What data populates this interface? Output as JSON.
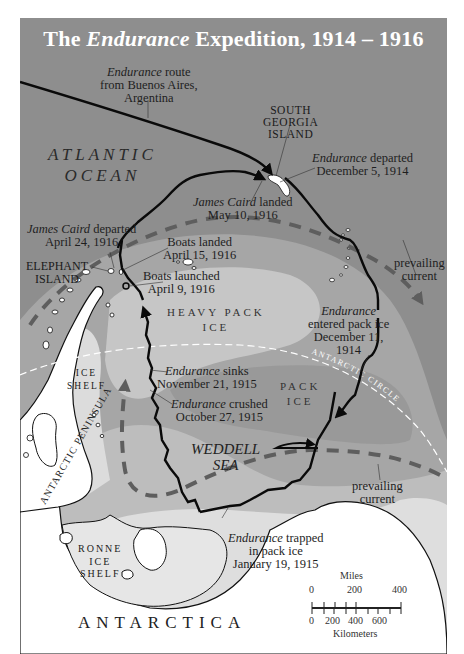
{
  "map": {
    "title_prefix": "The",
    "title_italic": "Endurance",
    "title_suffix": "Expedition, 1914 – 1916",
    "colors": {
      "ocean_dark": "#8e8e8e",
      "pack_ice": "#a9a9a9",
      "heavy_pack_ice": "#c4c4c4",
      "inner_ice": "#d2d2d2",
      "shelf": "#e4e4e4",
      "land": "#ffffff",
      "route": "#0a0a0a",
      "current": "#5e5e5e",
      "title": "#ffffff"
    },
    "regions": {
      "atlantic_line1": "ATLANTIC",
      "atlantic_line2": "OCEAN",
      "heavy_pack_line1": "HEAVY PACK",
      "heavy_pack_line2": "ICE",
      "pack_line1": "PACK",
      "pack_line2": "ICE",
      "weddell_line1": "WEDDELL",
      "weddell_line2": "SEA",
      "ice_shelf_line1": "ICE",
      "ice_shelf_line2": "SHELF",
      "ronne_line1": "RONNE",
      "ronne_line2": "ICE",
      "ronne_line3": "SHELF",
      "antarctica": "ANTARCTICA",
      "peninsula": "ANTARCTIC PENINSULA",
      "antarctic_circle": "ANTARCTIC CIRCLE",
      "south_georgia_line1": "SOUTH",
      "south_georgia_line2": "GEORGIA",
      "south_georgia_line3": "ISLAND",
      "elephant_line1": "ELEPHANT",
      "elephant_line2": "ISLAND"
    },
    "annotations": {
      "route_from_ba": {
        "italic": "Endurance",
        "text1": "route",
        "line2": "from Buenos Aires,",
        "line3": "Argentina"
      },
      "departed_sg": {
        "italic": "Endurance",
        "text1": "departed",
        "line2": "December 5, 1914"
      },
      "caird_landed": {
        "italic": "James Caird",
        "text1": "landed",
        "line2": "May 10, 1916"
      },
      "caird_departed": {
        "italic": "James Caird",
        "text1": "departed",
        "line2": "April 24, 1916"
      },
      "boats_landed": {
        "line1": "Boats landed",
        "line2": "April 15, 1916"
      },
      "boats_launched": {
        "line1": "Boats launched",
        "line2": "April 9, 1916"
      },
      "entered_pack": {
        "italic": "Endurance",
        "line2": "entered pack ice",
        "line3": "December 11,",
        "line4": "1914"
      },
      "sinks": {
        "italic": "Endurance",
        "text1": "sinks",
        "line2": "November 21, 1915"
      },
      "crushed": {
        "italic": "Endurance",
        "text1": "crushed",
        "line2": "October 27, 1915"
      },
      "trapped": {
        "italic": "Endurance",
        "text1": "trapped",
        "line2": "in pack ice",
        "line3": "January 19, 1915"
      },
      "current_east": {
        "line1": "prevailing",
        "line2": "current"
      },
      "current_south": {
        "line1": "prevailing",
        "line2": "current"
      }
    },
    "scale": {
      "miles_label": "Miles",
      "miles_ticks": [
        "0",
        "200",
        "400"
      ],
      "km_label": "Kilometers",
      "km_ticks": [
        "0",
        "200",
        "400",
        "600"
      ]
    }
  }
}
